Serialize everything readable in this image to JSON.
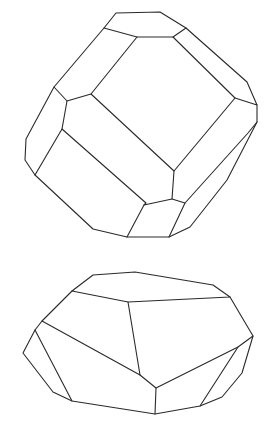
{
  "figure": {
    "stroke_color": "#2a2a2a",
    "background": "#ffffff",
    "crystals": [
      {
        "name": "upper-crystal",
        "edges": [
          "116,13 160,12 186,28 173,37 137,37 104,28 116,13",
          "104,28 54,87 67,101 91,94 137,37",
          "186,28 247,82 257,105 235,98 173,37",
          "54,87 26,139 25,160 35,175 93,229 127,237 169,237 190,227 227,180 257,122 257,105",
          "67,101 62,129 35,175",
          "62,129 146,203 144,205 172,199 174,171 91,94",
          "174,171 235,98",
          "144,205 127,237",
          "172,199 185,203 169,237",
          "185,203 248,133 257,122"
        ]
      },
      {
        "name": "lower-crystal",
        "edges": [
          "93,275 135,272 213,285 230,297 128,302 72,291 93,275",
          "72,291 42,321 35,330 23,353 53,392 72,401 155,414 200,406 222,397 242,373 253,336 230,297",
          "42,321 140,375 128,302",
          "35,330 72,401",
          "140,375 156,388 155,414",
          "156,388 238,347 253,336",
          "238,347 200,406"
        ]
      }
    ]
  }
}
